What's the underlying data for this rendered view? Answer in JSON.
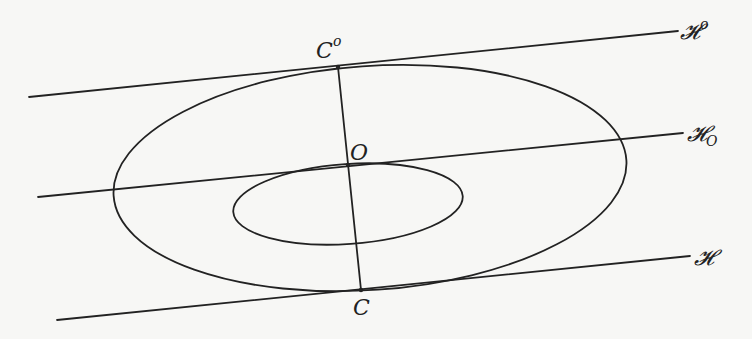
{
  "diagram": {
    "lines": [
      {
        "id": "H-upper",
        "label": "𝓗",
        "sup": "o",
        "x1": 29,
        "y1": 97,
        "x2": 678,
        "y2": 31
      },
      {
        "id": "H-O",
        "label": "𝓗",
        "sub": "O",
        "x1": 38,
        "y1": 197,
        "x2": 683,
        "y2": 133
      },
      {
        "id": "H",
        "label": "𝓗",
        "x1": 57,
        "y1": 320,
        "x2": 690,
        "y2": 256
      }
    ],
    "points": {
      "C_upper": {
        "label": "C",
        "sup": "o",
        "x": 338,
        "y": 67
      },
      "O": {
        "label": "O",
        "x": 348,
        "y": 165
      },
      "C": {
        "label": "C",
        "x": 361,
        "y": 290
      }
    },
    "labels": {
      "C_upper_main": "C",
      "C_upper_sup": "o",
      "O": "O",
      "C": "C",
      "H_upper_main": "𝓗",
      "H_upper_sup": "o",
      "H_O_main": "𝓗",
      "H_O_sub": "O",
      "H_main": "𝓗"
    },
    "ellipses": [
      {
        "id": "outer",
        "cx": 370,
        "cy": 178,
        "rx": 257,
        "ry": 112,
        "rotate": -4
      },
      {
        "id": "inner",
        "cx": 348,
        "cy": 204,
        "rx": 115,
        "ry": 40,
        "rotate": -4
      }
    ]
  }
}
